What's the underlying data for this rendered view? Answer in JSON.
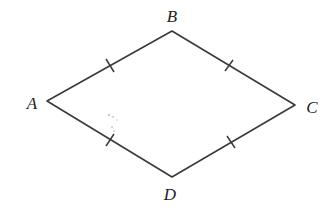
{
  "diagram": {
    "type": "rhombus",
    "stroke_color": "#3a3a3a",
    "label_color": "#222222",
    "background": "#ffffff",
    "vertices": {
      "A": {
        "label": "A",
        "x": 47,
        "y": 101,
        "label_x": 32,
        "label_y": 109
      },
      "B": {
        "label": "B",
        "x": 172,
        "y": 31,
        "label_x": 172,
        "label_y": 22
      },
      "C": {
        "label": "C",
        "x": 295,
        "y": 105,
        "label_x": 312,
        "label_y": 113
      },
      "D": {
        "label": "D",
        "x": 172,
        "y": 177,
        "label_x": 170,
        "label_y": 200
      }
    },
    "edges": [
      {
        "from": "A",
        "to": "B",
        "tick_marks": 1
      },
      {
        "from": "B",
        "to": "C",
        "tick_marks": 1
      },
      {
        "from": "C",
        "to": "D",
        "tick_marks": 1
      },
      {
        "from": "D",
        "to": "A",
        "tick_marks": 1
      }
    ]
  }
}
